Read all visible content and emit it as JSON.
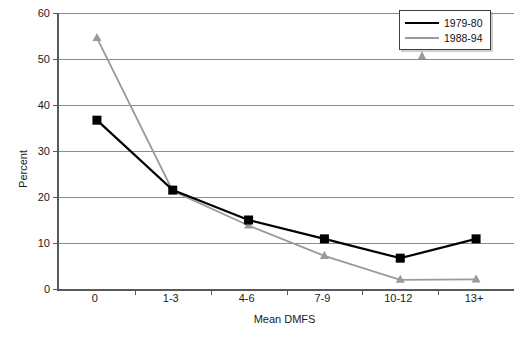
{
  "chart_data": {
    "type": "line",
    "title": "",
    "xlabel": "Mean DMFS",
    "ylabel": "Percent",
    "categories": [
      "0",
      "1-3",
      "4-6",
      "7-9",
      "10-12",
      "13+"
    ],
    "ylim": [
      0,
      60
    ],
    "yticks": [
      0,
      10,
      20,
      30,
      40,
      50,
      60
    ],
    "ytick_labels": [
      "0",
      "10",
      "20",
      "30",
      "40",
      "50",
      "60"
    ],
    "grid": "horizontal",
    "legend_position": "top-right",
    "series": [
      {
        "name": "1979-80",
        "marker": "square",
        "color": "#000000",
        "values": [
          36.7,
          21.5,
          15.0,
          10.9,
          6.7,
          10.9
        ]
      },
      {
        "name": "1988-94",
        "marker": "triangle",
        "color": "#9a9a9a",
        "values": [
          54.6,
          21.3,
          13.8,
          7.2,
          2.0,
          2.1
        ]
      }
    ]
  },
  "legend": {
    "items": [
      {
        "label": "1979-80"
      },
      {
        "label": "1988-94"
      }
    ]
  },
  "axes": {
    "y_title": "Percent",
    "x_title": "Mean DMFS"
  },
  "colors": {
    "series1": "#000000",
    "series2": "#9a9a9a",
    "grid": "#8c8c8c",
    "axis": "#58595b",
    "background": "#ffffff"
  }
}
